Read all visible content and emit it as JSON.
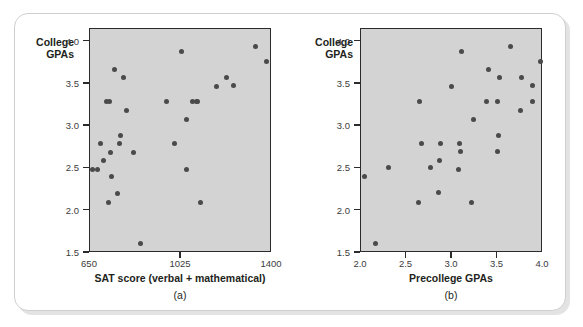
{
  "figure": {
    "panels": [
      {
        "id": "a",
        "caption": "(a)",
        "ylabel": "College\nGPAs",
        "xlabel": "SAT score (verbal + mathematical)"
      },
      {
        "id": "b",
        "caption": "(b)",
        "ylabel": "College\nGPAs",
        "xlabel": "Precollege GPAs"
      }
    ],
    "colors": {
      "plot_background": "#d3d3d3",
      "point": "#4a4a4a",
      "axis": "#2b2b2b",
      "text": "#231f20",
      "page_background": "#ffffff",
      "frame_border": "#cfcfcf",
      "frame_shadow": "#e3e3e3"
    }
  },
  "chart_data": [
    {
      "type": "scatter",
      "id": "a",
      "title": "",
      "xlabel": "SAT score (verbal + mathematical)",
      "ylabel": "College GPAs",
      "caption": "(a)",
      "xlim": [
        650,
        1400
      ],
      "ylim": [
        1.5,
        4.15
      ],
      "xticks": [
        650,
        1025,
        1400
      ],
      "xticklabels": [
        "650",
        "1025",
        "1400"
      ],
      "yticks": [
        1.5,
        2.0,
        2.5,
        3.0,
        3.5,
        4.0
      ],
      "yticklabels": [
        "1.5",
        "2.0",
        "2.5",
        "3.0",
        "3.5",
        "4.0"
      ],
      "grid": false,
      "legend": null,
      "points": [
        {
          "x": 662,
          "y": 2.49
        },
        {
          "x": 682,
          "y": 2.49
        },
        {
          "x": 692,
          "y": 2.79
        },
        {
          "x": 706,
          "y": 2.6
        },
        {
          "x": 716,
          "y": 3.29
        },
        {
          "x": 726,
          "y": 2.1
        },
        {
          "x": 730,
          "y": 3.29
        },
        {
          "x": 733,
          "y": 2.69
        },
        {
          "x": 737,
          "y": 2.4
        },
        {
          "x": 752,
          "y": 3.67
        },
        {
          "x": 763,
          "y": 2.2
        },
        {
          "x": 772,
          "y": 2.79
        },
        {
          "x": 776,
          "y": 2.89
        },
        {
          "x": 790,
          "y": 3.58
        },
        {
          "x": 800,
          "y": 3.19
        },
        {
          "x": 828,
          "y": 2.69
        },
        {
          "x": 857,
          "y": 1.61
        },
        {
          "x": 967,
          "y": 3.29
        },
        {
          "x": 1000,
          "y": 2.79
        },
        {
          "x": 1027,
          "y": 3.88
        },
        {
          "x": 1046,
          "y": 2.49
        },
        {
          "x": 1048,
          "y": 3.08
        },
        {
          "x": 1073,
          "y": 3.29
        },
        {
          "x": 1089,
          "y": 3.29
        },
        {
          "x": 1093,
          "y": 3.29
        },
        {
          "x": 1107,
          "y": 2.1
        },
        {
          "x": 1170,
          "y": 3.47
        },
        {
          "x": 1214,
          "y": 3.58
        },
        {
          "x": 1240,
          "y": 3.48
        },
        {
          "x": 1332,
          "y": 3.94
        },
        {
          "x": 1377,
          "y": 3.77
        }
      ]
    },
    {
      "type": "scatter",
      "id": "b",
      "title": "",
      "xlabel": "Precollege GPAs",
      "ylabel": "College GPAs",
      "caption": "(b)",
      "xlim": [
        2.0,
        4.0
      ],
      "ylim": [
        1.5,
        4.15
      ],
      "xticks": [
        2.0,
        2.5,
        3.0,
        3.5,
        4.0
      ],
      "xticklabels": [
        "2.0",
        "2.5",
        "3.0",
        "3.5",
        "4.0"
      ],
      "yticks": [
        1.5,
        2.0,
        2.5,
        3.0,
        3.5,
        4.0
      ],
      "yticklabels": [
        "1.5",
        "2.0",
        "2.5",
        "3.0",
        "3.5",
        "4.0"
      ],
      "grid": false,
      "legend": null,
      "points": [
        {
          "x": 2.04,
          "y": 2.4
        },
        {
          "x": 2.16,
          "y": 1.61
        },
        {
          "x": 2.3,
          "y": 2.51
        },
        {
          "x": 2.63,
          "y": 2.1
        },
        {
          "x": 2.64,
          "y": 3.29
        },
        {
          "x": 2.66,
          "y": 2.79
        },
        {
          "x": 2.76,
          "y": 2.51
        },
        {
          "x": 2.85,
          "y": 2.21
        },
        {
          "x": 2.86,
          "y": 2.6
        },
        {
          "x": 2.87,
          "y": 2.8
        },
        {
          "x": 2.99,
          "y": 3.47
        },
        {
          "x": 3.07,
          "y": 2.49
        },
        {
          "x": 3.08,
          "y": 2.8
        },
        {
          "x": 3.09,
          "y": 2.7
        },
        {
          "x": 3.1,
          "y": 3.88
        },
        {
          "x": 3.21,
          "y": 2.1
        },
        {
          "x": 3.24,
          "y": 3.08
        },
        {
          "x": 3.38,
          "y": 3.29
        },
        {
          "x": 3.4,
          "y": 3.67
        },
        {
          "x": 3.5,
          "y": 2.7
        },
        {
          "x": 3.5,
          "y": 3.29
        },
        {
          "x": 3.51,
          "y": 2.89
        },
        {
          "x": 3.52,
          "y": 3.58
        },
        {
          "x": 3.64,
          "y": 3.94
        },
        {
          "x": 3.75,
          "y": 3.19
        },
        {
          "x": 3.76,
          "y": 3.58
        },
        {
          "x": 3.88,
          "y": 3.29
        },
        {
          "x": 3.89,
          "y": 3.48
        },
        {
          "x": 3.97,
          "y": 3.77
        }
      ]
    }
  ]
}
